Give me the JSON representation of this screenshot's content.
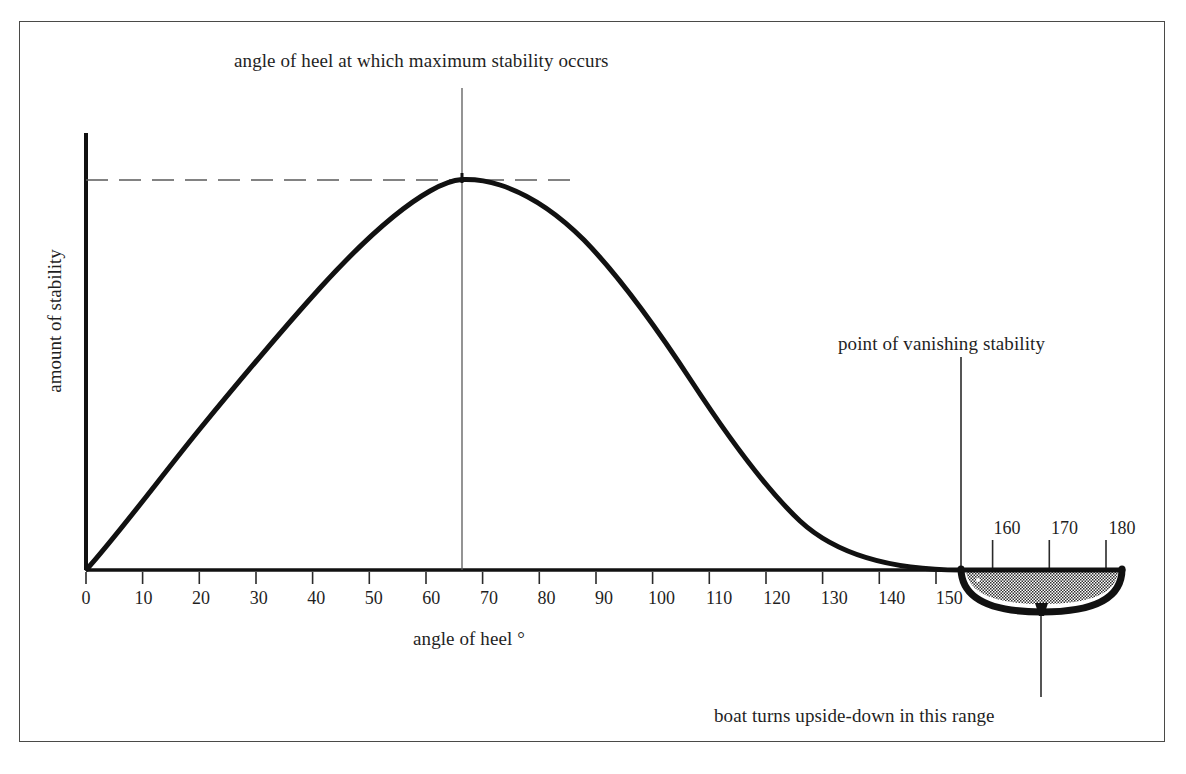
{
  "figure": {
    "title": "",
    "background": "#ffffff",
    "frame_color": "#4a4a48",
    "curve_color": "#111111",
    "hull_fill": "#808080",
    "hull_outline": "#111111"
  },
  "annotations": {
    "max_stability": "angle of heel at which maximum stability occurs",
    "vanishing_stability": "point of vanishing stability",
    "upside_down": "boat turns upside-down in this range"
  },
  "axes": {
    "x_title": "angle of heel °",
    "y_title": "amount of stability",
    "x_ticks_below": [
      "0",
      "10",
      "20",
      "30",
      "40",
      "50",
      "60",
      "70",
      "80",
      "90",
      "100",
      "110",
      "120",
      "130",
      "140",
      "150"
    ],
    "x_ticks_above": [
      "160",
      "170",
      "180"
    ]
  },
  "chart_data": {
    "type": "line",
    "title": "",
    "xlabel": "angle of heel °",
    "ylabel": "amount of stability",
    "xlim": [
      0,
      180
    ],
    "ylim": [
      0,
      1.05
    ],
    "grid": false,
    "legend": null,
    "x_tick_values": [
      0,
      10,
      20,
      30,
      40,
      50,
      60,
      70,
      80,
      90,
      100,
      110,
      120,
      130,
      140,
      150,
      160,
      170,
      180
    ],
    "y_tick_values": [],
    "series": [
      {
        "name": "righting moment",
        "x": [
          0,
          5,
          10,
          15,
          20,
          25,
          30,
          35,
          40,
          45,
          50,
          55,
          60,
          65,
          67,
          70,
          75,
          80,
          85,
          90,
          95,
          100,
          105,
          110,
          115,
          120,
          125,
          130,
          135,
          140,
          145,
          150,
          155
        ],
        "y": [
          0.0,
          0.075,
          0.152,
          0.229,
          0.307,
          0.384,
          0.459,
          0.532,
          0.6,
          0.663,
          0.72,
          0.77,
          0.813,
          0.843,
          0.85,
          0.847,
          0.832,
          0.806,
          0.772,
          0.731,
          0.684,
          0.632,
          0.575,
          0.513,
          0.446,
          0.377,
          0.307,
          0.238,
          0.172,
          0.11,
          0.055,
          0.015,
          0.0
        ]
      }
    ],
    "annotations": [
      {
        "label": "angle of heel at which maximum stability occurs",
        "x": 67,
        "y": 0.85,
        "type": "peak-callout"
      },
      {
        "label": "point of vanishing stability",
        "x": 155,
        "y": 0.0,
        "type": "zero-crossing-callout"
      },
      {
        "label": "boat turns upside-down in this range",
        "x": 170,
        "y": 0.0,
        "type": "range-callout"
      }
    ],
    "markers": {
      "max_stability_angle": 67,
      "vanishing_stability_angle": 155,
      "capsize_range": [
        155,
        180
      ],
      "max_stability_dashed_level": 0.85
    }
  }
}
